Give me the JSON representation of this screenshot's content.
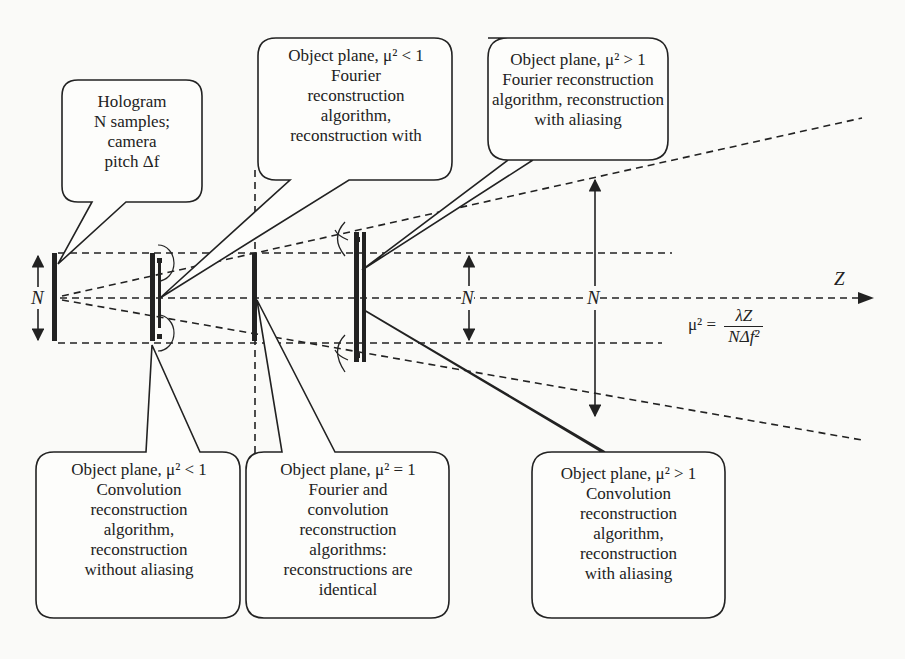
{
  "diagram": {
    "axis_label": "Z",
    "aperture_label": "N",
    "formula": {
      "lhs": "μ² =",
      "numerator": "λZ",
      "denominator": "NΔf²"
    },
    "callouts": {
      "hologram": "Hologram\nN samples;\ncamera\npitch Δf",
      "top_fourier_lt1": "Object plane, μ² < 1\nFourier\nreconstruction\nalgorithm,\nreconstruction with",
      "top_fourier_gt1": "Object plane, μ² > 1\nFourier reconstruction\nalgorithm, reconstruction\nwith aliasing",
      "bottom_conv_lt1": "Object plane, μ² < 1\nConvolution\nreconstruction\nalgorithm,\nreconstruction\nwithout aliasing",
      "bottom_eq1": "Object plane, μ²  = 1\nFourier and\nconvolution\nreconstruction\nalgorithms:\nreconstructions are\nidentical",
      "bottom_conv_gt1": "Object plane, μ² > 1\nConvolution\nreconstruction\nalgorithm,\nreconstruction\nwith aliasing"
    }
  }
}
